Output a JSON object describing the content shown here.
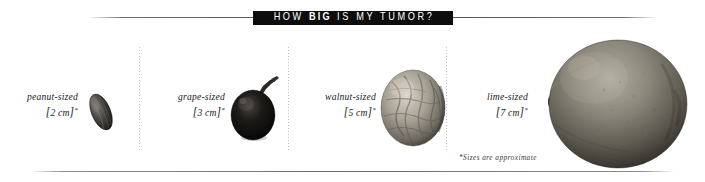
{
  "title": {
    "prefix": "HOW ",
    "emphasis": "BIG",
    "suffix": " IS MY TUMOR?",
    "full": "HOW BIG IS MY TUMOR?",
    "banner_bg": "#0d0d0d",
    "banner_fg": "#ffffff"
  },
  "footnote": "*Sizes are approximate",
  "items": [
    {
      "name_label": "peanut-sized",
      "size_open": "[",
      "size_value": "2 cm",
      "size_close": "]",
      "asterisk": "*",
      "specimen": "peanut"
    },
    {
      "name_label": "grape-sized",
      "size_open": "[",
      "size_value": "3 cm",
      "size_close": "]",
      "asterisk": "*",
      "specimen": "grape"
    },
    {
      "name_label": "walnut-sized",
      "size_open": "[",
      "size_value": "5 cm",
      "size_close": "]",
      "asterisk": "*",
      "specimen": "walnut"
    },
    {
      "name_label": "lime-sized",
      "size_open": "[",
      "size_value": "7 cm",
      "size_close": "]",
      "asterisk": "*",
      "specimen": "lime"
    }
  ],
  "colors": {
    "background": "#ffffff",
    "rule": "#6b6b6b",
    "divider": "#b9b9b9",
    "text": "#1a1a1a"
  }
}
